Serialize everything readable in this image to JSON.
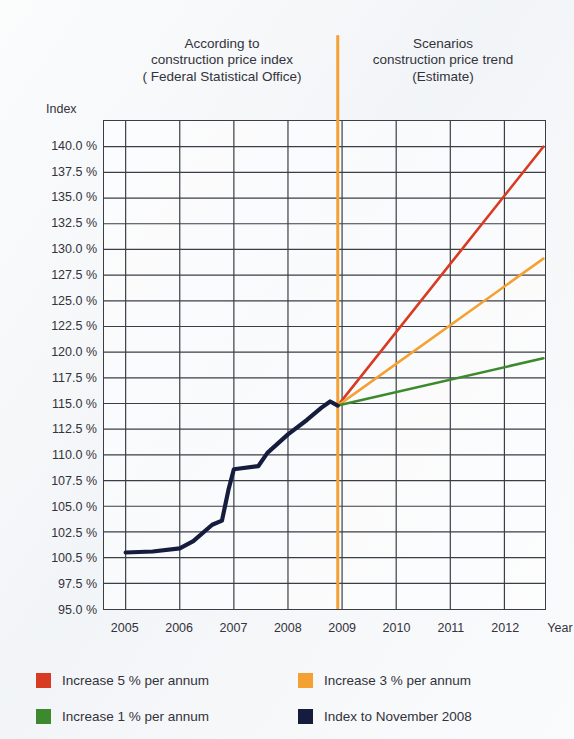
{
  "headers": {
    "left": [
      "According to",
      "construction price index",
      "( Federal Statistical Office)"
    ],
    "right": [
      "Scenarios",
      "construction price trend",
      "(Estimate)"
    ]
  },
  "axes": {
    "index_caption": "Index",
    "year_caption": "Year"
  },
  "colors": {
    "red": "#D93A22",
    "orange": "#F5A033",
    "green": "#3D8A2E",
    "navy": "#151C3E",
    "divider": "#F5A033",
    "grid": "#3a3f45",
    "background": "#f4f6f8"
  },
  "legend": [
    {
      "label": "Increase 5 % per annum",
      "color": "#D93A22",
      "name": "legend-increase-5"
    },
    {
      "label": "Increase 3 % per annum",
      "color": "#F5A033",
      "name": "legend-increase-3"
    },
    {
      "label": "Increase 1 % per annum",
      "color": "#3D8A2E",
      "name": "legend-increase-1"
    },
    {
      "label": "Index to November 2008",
      "color": "#151C3E",
      "name": "legend-index-nov-2008"
    }
  ],
  "chart_data": {
    "type": "line",
    "xlabel": "Year",
    "ylabel": "Index",
    "xlim": [
      2004.6,
      2012.75
    ],
    "ylim": [
      95.0,
      142.5
    ],
    "grid": true,
    "legend_position": "bottom",
    "x_tick_labels": [
      "2005",
      "2006",
      "2007",
      "2008",
      "2009",
      "2010",
      "2011",
      "2012"
    ],
    "x_tick_values": [
      2005,
      2006,
      2007,
      2008,
      2009,
      2010,
      2011,
      2012
    ],
    "y_tick_labels": [
      "140.0 %",
      "137.5 %",
      "135.0 %",
      "132.5 %",
      "130.0 %",
      "127.5 %",
      "125.0 %",
      "122.5 %",
      "120.0 %",
      "117.5 %",
      "115.0 %",
      "112.5 %",
      "110.0 %",
      "107.5 %",
      "105.0 %",
      "102.5 %",
      "100.5 %",
      "97.5 %",
      "95.0 %"
    ],
    "y_tick_values": [
      140.0,
      137.5,
      135.0,
      132.5,
      130.0,
      127.5,
      125.0,
      122.5,
      120.0,
      117.5,
      115.0,
      112.5,
      110.0,
      107.5,
      105.0,
      102.5,
      100.0,
      97.5,
      95.0
    ],
    "divider_x": 2008.92,
    "divider_note": "orange vertical line separating historical index from scenario projections",
    "series": [
      {
        "name": "Index to November 2008",
        "color": "#151C3E",
        "kind": "historical",
        "points": [
          [
            2005.0,
            100.5
          ],
          [
            2005.5,
            100.6
          ],
          [
            2006.0,
            100.9
          ],
          [
            2006.25,
            101.6
          ],
          [
            2006.6,
            103.2
          ],
          [
            2006.78,
            103.6
          ],
          [
            2006.9,
            106.6
          ],
          [
            2007.0,
            108.6
          ],
          [
            2007.45,
            108.9
          ],
          [
            2007.62,
            110.2
          ],
          [
            2008.0,
            112.0
          ],
          [
            2008.35,
            113.4
          ],
          [
            2008.62,
            114.6
          ],
          [
            2008.78,
            115.2
          ],
          [
            2008.92,
            114.8
          ]
        ]
      },
      {
        "name": "Increase 5 % per annum",
        "color": "#D93A22",
        "kind": "scenario",
        "points": [
          [
            2008.92,
            114.8
          ],
          [
            2012.72,
            140.0
          ]
        ]
      },
      {
        "name": "Increase 3 % per annum",
        "color": "#F5A033",
        "kind": "scenario",
        "points": [
          [
            2008.92,
            114.8
          ],
          [
            2012.72,
            129.1
          ]
        ]
      },
      {
        "name": "Increase 1 % per annum",
        "color": "#3D8A2E",
        "kind": "scenario",
        "points": [
          [
            2008.92,
            114.8
          ],
          [
            2012.72,
            119.4
          ]
        ]
      }
    ]
  }
}
